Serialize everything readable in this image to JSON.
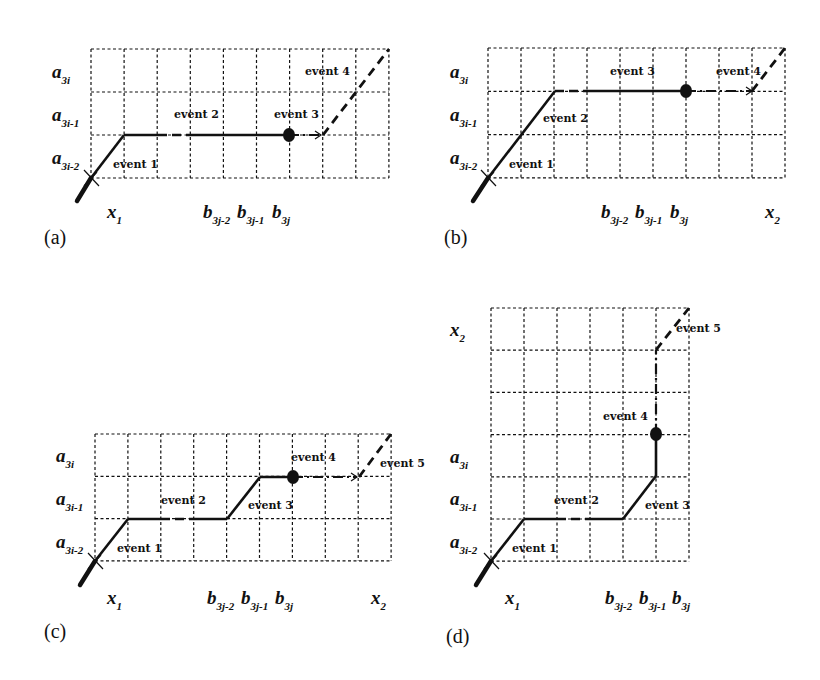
{
  "figure": {
    "panels": [
      {
        "id": "a",
        "tag": "(a)",
        "tag_pos": [
          44,
          244
        ],
        "grid": {
          "x0": 91,
          "y0": 49,
          "cols": 9,
          "rows": 3,
          "cw": 33.1,
          "rh": 43
        },
        "row_labels": [
          {
            "main": "a",
            "sub": "3i",
            "x": 52,
            "y": 78
          },
          {
            "main": "a",
            "sub": "3i-1",
            "x": 52,
            "y": 121
          },
          {
            "main": "a",
            "sub": "3i-2",
            "x": 52,
            "y": 164
          }
        ],
        "col_labels": [
          {
            "main": "x",
            "sub": "1",
            "x": 107,
            "y": 218
          },
          {
            "main": "b",
            "sub": "3j-2",
            "x": 203,
            "y": 218
          },
          {
            "main": "b",
            "sub": "3j-1",
            "x": 237,
            "y": 218
          },
          {
            "main": "b",
            "sub": "3j",
            "x": 272,
            "y": 218
          }
        ],
        "events": [
          {
            "text": "event 1",
            "x": 113,
            "y": 168
          },
          {
            "text": "event 2",
            "x": 174,
            "y": 118
          },
          {
            "text": "event 3",
            "x": 274,
            "y": 118
          },
          {
            "text": "event 4",
            "x": 305,
            "y": 75
          }
        ],
        "thick": [
          [
            77,
            201,
            91,
            178
          ]
        ],
        "solid": [
          [
            91,
            178,
            124,
            135
          ],
          [
            124,
            135,
            158,
            135
          ],
          [
            191,
            135,
            289,
            135
          ]
        ],
        "dash": [
          [
            158,
            135,
            191,
            135
          ]
        ],
        "dashdot": [
          [
            289,
            135,
            321,
            135
          ]
        ],
        "diag_dash": [
          [
            323,
            135,
            389,
            49
          ]
        ],
        "dots": [
          [
            289,
            135
          ]
        ],
        "crosses": [
          [
            91,
            178
          ]
        ]
      },
      {
        "id": "b",
        "tag": "(b)",
        "tag_pos": [
          444,
          244
        ],
        "grid": {
          "x0": 488,
          "y0": 48,
          "cols": 9,
          "rows": 3,
          "cw": 33,
          "rh": 43.3
        },
        "row_labels": [
          {
            "main": "a",
            "sub": "3i",
            "x": 450,
            "y": 78
          },
          {
            "main": "a",
            "sub": "3i-1",
            "x": 450,
            "y": 121
          },
          {
            "main": "a",
            "sub": "3i-2",
            "x": 450,
            "y": 164
          }
        ],
        "col_labels": [
          {
            "main": "b",
            "sub": "3j-2",
            "x": 601,
            "y": 218
          },
          {
            "main": "b",
            "sub": "3j-1",
            "x": 635,
            "y": 218
          },
          {
            "main": "b",
            "sub": "3j",
            "x": 670,
            "y": 218
          },
          {
            "main": "x",
            "sub": "2",
            "x": 765,
            "y": 218
          }
        ],
        "events": [
          {
            "text": "event 1",
            "x": 509,
            "y": 168
          },
          {
            "text": "event 2",
            "x": 543,
            "y": 122
          },
          {
            "text": "event 3",
            "x": 610,
            "y": 75
          },
          {
            "text": "event 4",
            "x": 716,
            "y": 75
          }
        ],
        "thick": [
          [
            473,
            201,
            488,
            178
          ]
        ],
        "solid": [
          [
            488,
            178,
            555,
            91
          ],
          [
            588,
            91,
            686,
            91
          ]
        ],
        "dash": [
          [
            555,
            91,
            588,
            91
          ]
        ],
        "dashdot": [
          [
            686,
            91,
            752,
            91
          ]
        ],
        "diag_dash": [
          [
            752,
            91,
            785,
            48
          ]
        ],
        "dots": [
          [
            686,
            91
          ]
        ],
        "crosses": [
          [
            488,
            178
          ]
        ]
      },
      {
        "id": "c",
        "tag": "(c)",
        "tag_pos": [
          44,
          638
        ],
        "grid": {
          "x0": 95,
          "y0": 434,
          "cols": 9,
          "rows": 3,
          "cw": 32.9,
          "rh": 42.3
        },
        "row_labels": [
          {
            "main": "a",
            "sub": "3i",
            "x": 56,
            "y": 462
          },
          {
            "main": "a",
            "sub": "3i-1",
            "x": 56,
            "y": 505
          },
          {
            "main": "a",
            "sub": "3i-2",
            "x": 56,
            "y": 548
          }
        ],
        "col_labels": [
          {
            "main": "x",
            "sub": "1",
            "x": 107,
            "y": 604
          },
          {
            "main": "b",
            "sub": "3j-2",
            "x": 207,
            "y": 604
          },
          {
            "main": "b",
            "sub": "3j-1",
            "x": 241,
            "y": 604
          },
          {
            "main": "b",
            "sub": "3j",
            "x": 275,
            "y": 604
          },
          {
            "main": "x",
            "sub": "2",
            "x": 371,
            "y": 604
          }
        ],
        "events": [
          {
            "text": "event 1",
            "x": 117,
            "y": 552
          },
          {
            "text": "event 2",
            "x": 161,
            "y": 504
          },
          {
            "text": "event 3",
            "x": 248,
            "y": 509
          },
          {
            "text": "event 4",
            "x": 291,
            "y": 461
          },
          {
            "text": "event 5",
            "x": 380,
            "y": 467
          }
        ],
        "thick": [
          [
            80,
            585,
            95,
            561
          ]
        ],
        "solid": [
          [
            95,
            561,
            128,
            519
          ],
          [
            128,
            519,
            161,
            519
          ],
          [
            194,
            519,
            227,
            519
          ],
          [
            227,
            519,
            260,
            477
          ],
          [
            260,
            477,
            293,
            477
          ]
        ],
        "dash": [
          [
            161,
            519,
            194,
            519
          ]
        ],
        "dashdot": [
          [
            293,
            477,
            357,
            477
          ]
        ],
        "diag_dash": [
          [
            359,
            477,
            391,
            434
          ]
        ],
        "dots": [
          [
            293,
            477
          ]
        ],
        "crosses": [
          [
            95,
            561
          ]
        ]
      },
      {
        "id": "d",
        "tag": "(d)",
        "tag_pos": [
          446,
          643
        ],
        "grid": {
          "x0": 491,
          "y0": 308,
          "cols": 6,
          "rows": 6,
          "cw": 33,
          "rh": 42.2
        },
        "row_labels": [
          {
            "main": "x",
            "sub": "2",
            "x": 450,
            "y": 336
          },
          {
            "main": "a",
            "sub": "3i",
            "x": 450,
            "y": 463
          },
          {
            "main": "a",
            "sub": "3i-1",
            "x": 450,
            "y": 505
          },
          {
            "main": "a",
            "sub": "3i-2",
            "x": 450,
            "y": 548
          }
        ],
        "col_labels": [
          {
            "main": "x",
            "sub": "1",
            "x": 505,
            "y": 604
          },
          {
            "main": "b",
            "sub": "3j-2",
            "x": 605,
            "y": 604
          },
          {
            "main": "b",
            "sub": "3j-1",
            "x": 639,
            "y": 604
          },
          {
            "main": "b",
            "sub": "3j",
            "x": 672,
            "y": 604
          }
        ],
        "events": [
          {
            "text": "event 1",
            "x": 512,
            "y": 552
          },
          {
            "text": "event 2",
            "x": 554,
            "y": 504
          },
          {
            "text": "event 3",
            "x": 645,
            "y": 509
          },
          {
            "text": "event 4",
            "x": 603,
            "y": 420
          },
          {
            "text": "event 5",
            "x": 676,
            "y": 332
          }
        ],
        "thick": [
          [
            476,
            585,
            491,
            561
          ]
        ],
        "solid": [
          [
            491,
            561,
            524,
            519
          ],
          [
            524,
            519,
            557,
            519
          ],
          [
            590,
            519,
            623,
            519
          ],
          [
            623,
            519,
            656,
            476
          ],
          [
            656,
            476,
            656,
            434
          ]
        ],
        "dash": [
          [
            557,
            519,
            590,
            519
          ]
        ],
        "dashdot": [
          [
            656,
            434,
            656,
            350
          ]
        ],
        "diag_dash": [
          [
            656,
            350,
            689,
            308
          ]
        ],
        "dots": [
          [
            656,
            434
          ]
        ],
        "crosses": [
          [
            491,
            561
          ]
        ]
      }
    ]
  }
}
